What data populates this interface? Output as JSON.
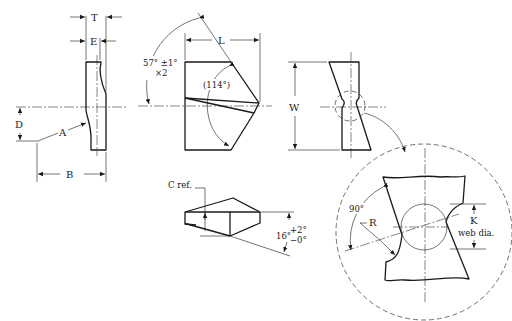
{
  "figure": {
    "type": "drill point geometry technical drawing",
    "dimension_labels": {
      "T": "T",
      "E": "E",
      "D": "D",
      "A": "A",
      "B": "B",
      "L": "L",
      "W": "W",
      "point_angle": "57° ±1°",
      "point_angle_mult": "×2",
      "included_angle": "(114°)",
      "c_ref": "C ref.",
      "clearance_angle": "16°",
      "clearance_tol_plus": "+2°",
      "clearance_tol_minus": "−0°",
      "detail_angle": "90°",
      "R": "R",
      "K": "K",
      "web_dia": "web dia."
    },
    "views": [
      "side-view",
      "front-view",
      "end-view",
      "bottom-view",
      "detail-view-web"
    ]
  }
}
